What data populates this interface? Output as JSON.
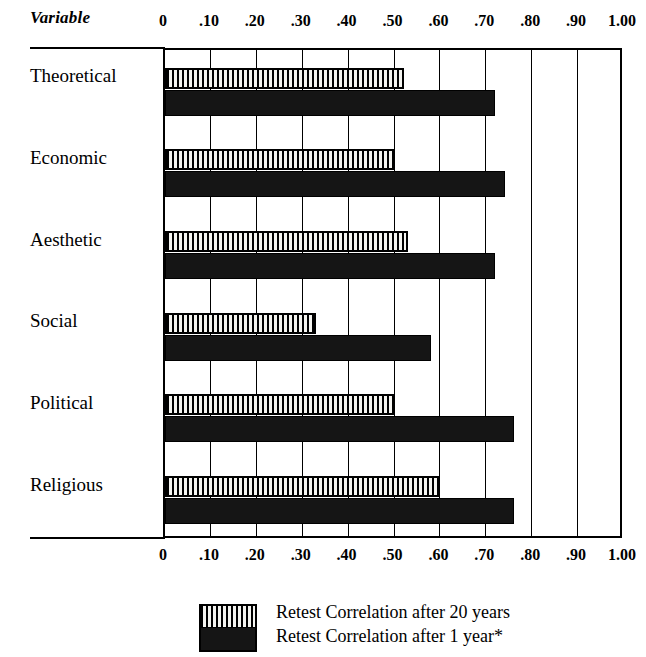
{
  "header": {
    "variable_label": "Variable"
  },
  "axis": {
    "tick_labels": [
      "0",
      ".10",
      ".20",
      ".30",
      ".40",
      ".50",
      ".60",
      ".70",
      ".80",
      ".90",
      "1.00"
    ],
    "tick_values": [
      0,
      0.1,
      0.2,
      0.3,
      0.4,
      0.5,
      0.6,
      0.7,
      0.8,
      0.9,
      1.0
    ]
  },
  "legend": {
    "items": [
      {
        "label": "Retest Correlation after 20 years",
        "pattern": "vertical-hatch"
      },
      {
        "label": "Retest Correlation after 1 year*",
        "pattern": "solid-black"
      }
    ]
  },
  "chart_data": {
    "type": "bar",
    "orientation": "horizontal",
    "title": "",
    "xlabel": "",
    "ylabel": "Variable",
    "xlim": [
      0,
      1.0
    ],
    "grid": true,
    "legend_position": "bottom",
    "categories": [
      "Theoretical",
      "Economic",
      "Aesthetic",
      "Social",
      "Political",
      "Religious"
    ],
    "series": [
      {
        "name": "Retest Correlation after 20 years",
        "pattern": "vertical-hatch",
        "values": [
          0.52,
          0.5,
          0.53,
          0.33,
          0.5,
          0.6
        ]
      },
      {
        "name": "Retest Correlation after 1 year*",
        "pattern": "solid-black",
        "values": [
          0.72,
          0.74,
          0.72,
          0.58,
          0.76,
          0.76
        ]
      }
    ],
    "annotations": [
      "*"
    ]
  }
}
